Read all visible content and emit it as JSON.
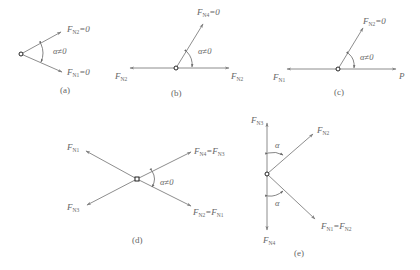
{
  "diagrams": [
    {
      "id": "a",
      "caption": "(a)",
      "angle": "α≠0",
      "labels": [
        {
          "text": "F",
          "sub": "N2",
          "suffix": "=0"
        },
        {
          "text": "F",
          "sub": "N1",
          "suffix": "=0"
        }
      ]
    },
    {
      "id": "b",
      "caption": "(b)",
      "angle": "α≠0",
      "labels": [
        {
          "text": "F",
          "sub": "N4",
          "suffix": "=0"
        },
        {
          "text": "F",
          "sub": "N2",
          "suffix": ""
        },
        {
          "text": "F",
          "sub": "N2",
          "suffix": ""
        }
      ]
    },
    {
      "id": "c",
      "caption": "(c)",
      "angle": "α≠0",
      "labels": [
        {
          "text": "F",
          "sub": "N2",
          "suffix": "=0"
        },
        {
          "text": "F",
          "sub": "N1",
          "suffix": ""
        },
        {
          "text": "P",
          "sub": "",
          "suffix": ""
        }
      ]
    },
    {
      "id": "d",
      "caption": "(d)",
      "angle": "α≠0",
      "labels": [
        {
          "text": "F",
          "sub": "N1",
          "suffix": ""
        },
        {
          "text": "F",
          "sub": "N3",
          "suffix": ""
        },
        {
          "text": "F",
          "sub": "N4",
          "suffix": "=F",
          "sub2": "N3"
        },
        {
          "text": "F",
          "sub": "N2",
          "suffix": "=F",
          "sub2": "N1"
        }
      ]
    },
    {
      "id": "e",
      "caption": "(e)",
      "angle_upper": "α",
      "angle_lower": "α",
      "labels": [
        {
          "text": "F",
          "sub": "N3",
          "suffix": ""
        },
        {
          "text": "F",
          "sub": "N2",
          "suffix": ""
        },
        {
          "text": "F",
          "sub": "N1",
          "suffix": "=F",
          "sub2": "N2"
        },
        {
          "text": "F",
          "sub": "N4",
          "suffix": ""
        }
      ]
    }
  ],
  "colors": {
    "line": "#808080",
    "text": "#666666",
    "node": "#222222"
  }
}
